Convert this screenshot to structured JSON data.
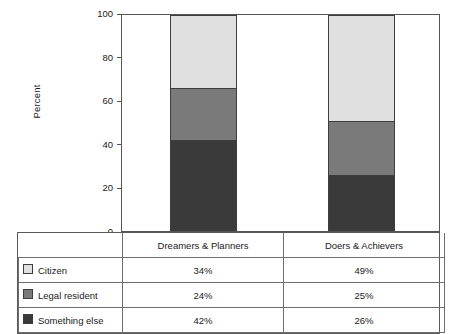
{
  "chart_data": {
    "type": "bar",
    "subtype": "stacked-percent",
    "title": "",
    "xlabel": "",
    "ylabel": "Percent",
    "ylim": [
      0,
      100
    ],
    "yticks": [
      0,
      20,
      40,
      60,
      80,
      100
    ],
    "ytick_labels": [
      "0",
      "20",
      "40",
      "60",
      "80",
      "100"
    ],
    "grid": false,
    "legend_position": "table-below",
    "categories": [
      "Dreamers & Planners",
      "Doers & Achievers"
    ],
    "series": [
      {
        "name": "Citizen",
        "values": [
          34,
          49
        ],
        "labels": [
          "34%",
          "49%"
        ],
        "color": "#e0e0e0"
      },
      {
        "name": "Legal resident",
        "values": [
          24,
          25
        ],
        "labels": [
          "24%",
          "25%"
        ],
        "color": "#7a7a7a"
      },
      {
        "name": "Something else",
        "values": [
          42,
          26
        ],
        "labels": [
          "42%",
          "26%"
        ],
        "color": "#3a3a3a"
      }
    ],
    "stack_order_bottom_to_top": [
      "Something else",
      "Legal resident",
      "Citizen"
    ]
  },
  "axis": {
    "y_label": "Percent",
    "ticks": [
      {
        "value": 100,
        "label": "100"
      },
      {
        "value": 80,
        "label": "80"
      },
      {
        "value": 60,
        "label": "60"
      },
      {
        "value": 40,
        "label": "40"
      },
      {
        "value": 20,
        "label": "20"
      },
      {
        "value": 0,
        "label": "0"
      }
    ]
  },
  "table": {
    "header": [
      "",
      "Dreamers & Planners",
      "Doers & Achievers"
    ],
    "rows": [
      {
        "label": "Citizen",
        "swatch": "#e0e0e0",
        "values": [
          "34%",
          "49%"
        ]
      },
      {
        "label": "Legal resident",
        "swatch": "#7a7a7a",
        "values": [
          "24%",
          "25%"
        ]
      },
      {
        "label": "Something else",
        "swatch": "#3a3a3a",
        "values": [
          "42%",
          "26%"
        ]
      }
    ]
  }
}
